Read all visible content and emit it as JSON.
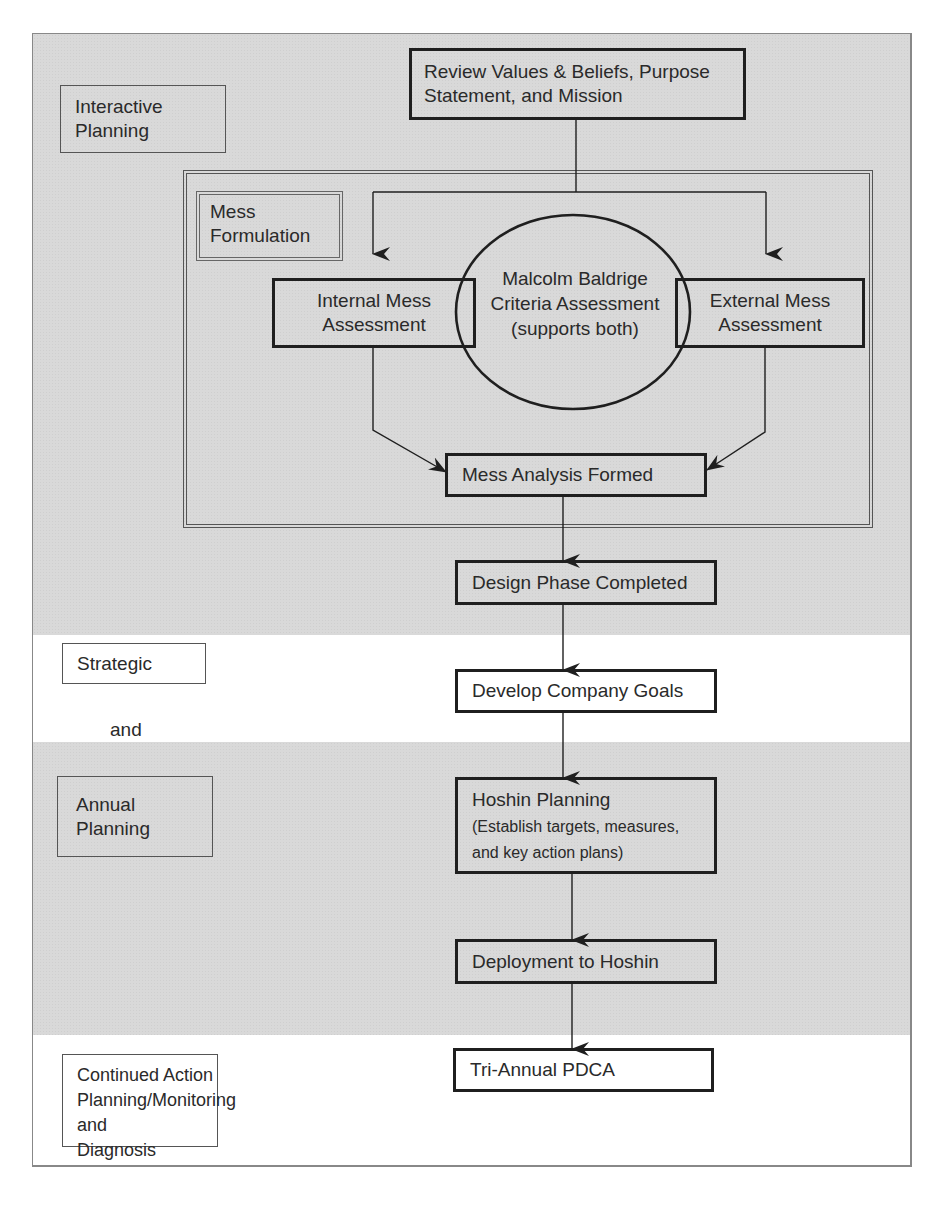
{
  "colors": {
    "band_gray": "#d9d9d9",
    "band_white": "#ffffff",
    "line": "#1f1f1f"
  },
  "phase_labels": {
    "interactive_planning": "Interactive\nPlanning",
    "mess_formulation": "Mess\nFormulation",
    "strategic": "Strategic",
    "and": "and",
    "annual_planning": "Annual\nPlanning",
    "continued_action": "Continued Action\nPlanning/Monitoring and\nDiagnosis"
  },
  "nodes": {
    "review_values": "Review Values & Beliefs, Purpose\nStatement, and Mission",
    "internal_mess": "Internal Mess\nAssessment",
    "malcolm_baldrige": "Malcolm Baldrige\nCriteria Assessment\n(supports both)",
    "external_mess": "External Mess\nAssessment",
    "mess_analysis": "Mess Analysis Formed",
    "design_phase": "Design Phase Completed",
    "company_goals": "Develop Company Goals",
    "hoshin_planning_title": "Hoshin Planning",
    "hoshin_planning_detail": "(Establish targets, measures,\nand key action plans)",
    "deployment": "Deployment to Hoshin",
    "tri_annual": "Tri-Annual PDCA"
  }
}
